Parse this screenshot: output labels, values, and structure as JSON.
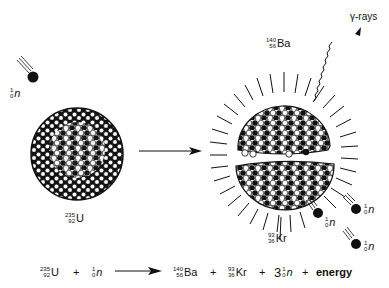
{
  "diagram": {
    "incoming_neutron": {
      "mass": "1",
      "atomic": "0",
      "symbol": "n"
    },
    "parent_nucleus": {
      "mass": "235",
      "atomic": "92",
      "symbol": "U"
    },
    "products": {
      "barium": {
        "mass": "140",
        "atomic": "56",
        "symbol": "Ba"
      },
      "krypton": {
        "mass": "93",
        "atomic": "36",
        "symbol": "Kr"
      },
      "neutrons": [
        {
          "mass": "1",
          "atomic": "0",
          "symbol": "n"
        },
        {
          "mass": "1",
          "atomic": "0",
          "symbol": "n"
        },
        {
          "mass": "1",
          "atomic": "0",
          "symbol": "n"
        }
      ]
    },
    "gamma_label": "γ-rays",
    "colors": {
      "ink": "#111111",
      "background": "#ffffff"
    }
  },
  "equation": {
    "reactant1": {
      "mass": "235",
      "atomic": "92",
      "symbol": "U"
    },
    "plus1": "+",
    "reactant2": {
      "mass": "1",
      "atomic": "0",
      "symbol": "n"
    },
    "product1": {
      "mass": "140",
      "atomic": "56",
      "symbol": "Ba"
    },
    "plus2": "+",
    "product2": {
      "mass": "93",
      "atomic": "36",
      "symbol": "Kr"
    },
    "plus3": "+",
    "coefficient": "3",
    "product3": {
      "mass": "1",
      "atomic": "0",
      "symbol": "n"
    },
    "plus4": "+",
    "energy": "energy"
  }
}
